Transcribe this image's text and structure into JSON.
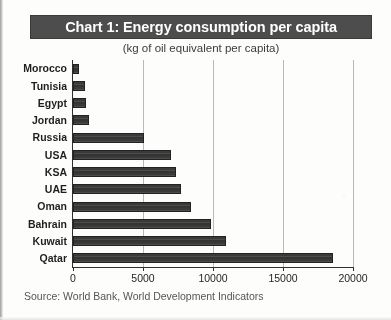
{
  "chart_data": {
    "type": "bar",
    "orientation": "horizontal",
    "title": "Chart 1: Energy consumption per capita",
    "subtitle": "(kg of oil equivalent per capita)",
    "source": "Source: World Bank, World Development Indicators",
    "xlabel": "",
    "ylabel": "",
    "xlim": [
      0,
      20000
    ],
    "xticks": [
      "0",
      "5000",
      "10000",
      "15000",
      "20000"
    ],
    "xtick_values": [
      0,
      5000,
      10000,
      15000,
      20000
    ],
    "grid": "vertical",
    "legend": "none",
    "categories": [
      "Morocco",
      "Tunisia",
      "Egypt",
      "Jordan",
      "Russia",
      "USA",
      "KSA",
      "UAE",
      "Oman",
      "Bahrain",
      "Kuwait",
      "Qatar"
    ],
    "values": [
      450,
      850,
      950,
      1150,
      5100,
      7000,
      7350,
      7700,
      8400,
      9850,
      10900,
      18550
    ],
    "bars": [
      {
        "label": "Morocco",
        "value": 450
      },
      {
        "label": "Tunisia",
        "value": 850
      },
      {
        "label": "Egypt",
        "value": 950
      },
      {
        "label": "Jordan",
        "value": 1150
      },
      {
        "label": "Russia",
        "value": 5100
      },
      {
        "label": "USA",
        "value": 7000
      },
      {
        "label": "KSA",
        "value": 7350
      },
      {
        "label": "UAE",
        "value": 7700
      },
      {
        "label": "Oman",
        "value": 8400
      },
      {
        "label": "Bahrain",
        "value": 9850
      },
      {
        "label": "Kuwait",
        "value": 10900
      },
      {
        "label": "Qatar",
        "value": 18550
      }
    ],
    "colors": {
      "bar_fill": "#3a3a3a",
      "bar_edge": "#222222",
      "title_band": "#4d4d4d",
      "title_text": "#ffffff",
      "grid": "#b9b9b9",
      "axis": "#2f2f2f",
      "page_background": "#fdfdfc"
    }
  }
}
